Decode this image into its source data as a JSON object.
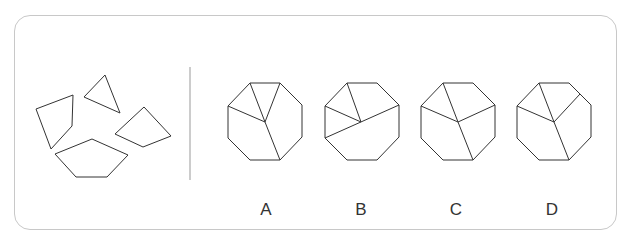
{
  "puzzle": {
    "question_figure": "four-pieces",
    "options": [
      {
        "label": "A"
      },
      {
        "label": "B"
      },
      {
        "label": "C"
      },
      {
        "label": "D"
      }
    ]
  },
  "colors": {
    "stroke": "#333333",
    "border": "#c8c8c8"
  }
}
